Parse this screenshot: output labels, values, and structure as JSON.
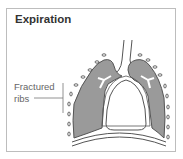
{
  "diagram": {
    "title": "Expiration",
    "annotations": [
      {
        "text_line1": "Fractured",
        "text_line2": "ribs"
      }
    ],
    "colors": {
      "lung_fill": "#9a9a9a",
      "outline": "#555555",
      "border": "#bdbdbd",
      "title": "#333333",
      "label": "#666666"
    }
  }
}
